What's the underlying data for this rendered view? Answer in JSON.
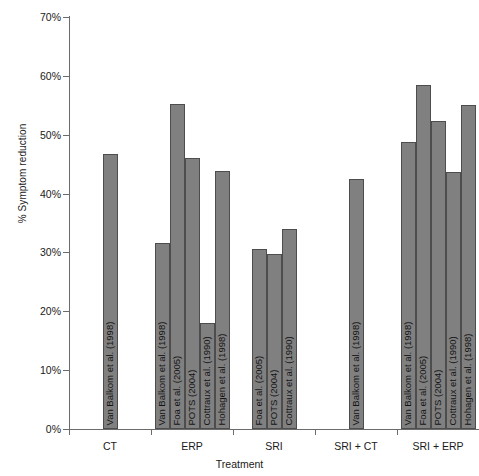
{
  "chart_data": {
    "type": "bar",
    "title": "",
    "xlabel": "Treatment",
    "ylabel": "% Symptom reduction",
    "ylim": [
      0,
      70
    ],
    "y_tick_labels": [
      "0%",
      "10%",
      "20%",
      "30%",
      "40%",
      "50%",
      "60%",
      "70%"
    ],
    "y_tick_values": [
      0,
      10,
      20,
      30,
      40,
      50,
      60,
      70
    ],
    "grid": false,
    "legend": "none",
    "categories": [
      "CT",
      "ERP",
      "SRI",
      "SRI + CT",
      "SRI + ERP"
    ],
    "groups": [
      {
        "category": "CT",
        "bars": [
          {
            "label": "Van Balkom et al. (1998)",
            "value": 46.8
          }
        ]
      },
      {
        "category": "ERP",
        "bars": [
          {
            "label": "Van Balkom et al. (1998)",
            "value": 31.6
          },
          {
            "label": "Foa et al. (2005)",
            "value": 55.2
          },
          {
            "label": "POTS (2004)",
            "value": 46.0
          },
          {
            "label": "Cottraux et al. (1990)",
            "value": 18.0
          },
          {
            "label": "Hohagen et al. (1998)",
            "value": 43.9
          }
        ]
      },
      {
        "category": "SRI",
        "bars": [
          {
            "label": "Foa et al. (2005)",
            "value": 30.6
          },
          {
            "label": "POTS (2004)",
            "value": 29.8
          },
          {
            "label": "Cottraux et al. (1990)",
            "value": 34.0
          }
        ]
      },
      {
        "category": "SRI + CT",
        "bars": [
          {
            "label": "Van Balkom et al. (1998)",
            "value": 42.4
          }
        ]
      },
      {
        "category": "SRI + ERP",
        "bars": [
          {
            "label": "Van Balkom et al. (1998)",
            "value": 48.7
          },
          {
            "label": "Foa et al. (2005)",
            "value": 58.4
          },
          {
            "label": "POTS (2004)",
            "value": 52.4
          },
          {
            "label": "Cottraux et al. (1990)",
            "value": 43.7
          },
          {
            "label": "Hohagen et al. (1998)",
            "value": 55.1
          }
        ]
      }
    ],
    "colors": {
      "bar_fill": "#808080",
      "bar_border": "#4d4d4d",
      "axis": "#6b6b6b",
      "text": "#1a1a1a",
      "background": "#ffffff"
    }
  }
}
